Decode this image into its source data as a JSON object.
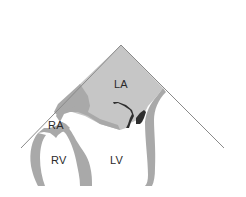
{
  "diagram": {
    "type": "echocardiography-sector-view",
    "labels": {
      "la": "LA",
      "ra": "RA",
      "rv": "RV",
      "lv": "LV"
    },
    "colors": {
      "background": "#ffffff",
      "atrium_fill": "#c6c6c6",
      "wall_fill": "#a9a9a9",
      "valve_fill": "#2e2e2e",
      "sector_line": "#8a8a8a",
      "label_text": "#2a2a2a"
    }
  }
}
